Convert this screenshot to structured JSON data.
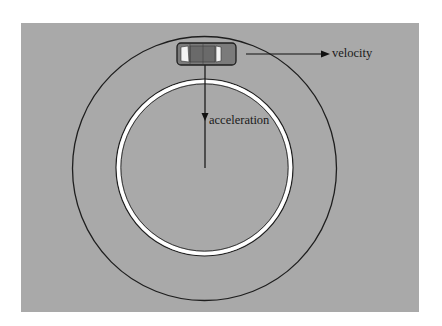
{
  "figure": {
    "colors": {
      "page_background": "#ffffff",
      "field_background": "#a9a9a9",
      "circle_stroke": "#1e1e1e",
      "ring_fill": "#ffffff",
      "car_body": "#7b7b7b",
      "car_roof": "#6a6a6a",
      "car_window": "#f4f4f4",
      "arrow_color": "#111111"
    },
    "labels": {
      "velocity": "velocity",
      "acceleration": "acceleration"
    },
    "icons": {
      "car": "car-icon",
      "velocity_arrow": "arrow-right-icon",
      "acceleration_arrow": "arrow-down-icon"
    }
  }
}
